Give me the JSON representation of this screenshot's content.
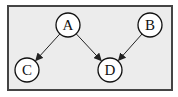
{
  "diagram": {
    "type": "directed-graph",
    "frame": {
      "x": 8,
      "y": 6,
      "width": 164,
      "height": 84,
      "fill": "#ececec",
      "stroke": "#444444"
    },
    "node_style": {
      "radius": 12,
      "fill": "#ffffff",
      "stroke": "#111111"
    },
    "edge_color": "#222222",
    "nodes": [
      {
        "id": "A",
        "label": "A",
        "cx": 68,
        "cy": 25
      },
      {
        "id": "B",
        "label": "B",
        "cx": 150,
        "cy": 25
      },
      {
        "id": "C",
        "label": "C",
        "cx": 27,
        "cy": 70
      },
      {
        "id": "D",
        "label": "D",
        "cx": 110,
        "cy": 70
      }
    ],
    "edges": [
      {
        "from": "A",
        "to": "C"
      },
      {
        "from": "A",
        "to": "D"
      },
      {
        "from": "B",
        "to": "D"
      }
    ]
  }
}
